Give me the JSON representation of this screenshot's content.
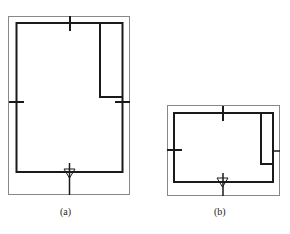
{
  "figures": [
    {
      "id": "a",
      "label": "(a)"
    },
    {
      "id": "b",
      "label": "(b)"
    }
  ],
  "colors": {
    "outline": "#888888",
    "wall": "#1a1a1a"
  }
}
